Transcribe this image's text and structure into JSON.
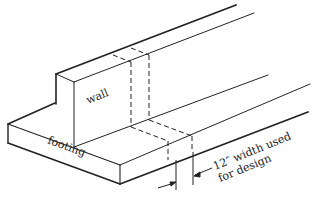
{
  "figure": {
    "type": "isometric-section",
    "labels": {
      "wall": "wall",
      "footing": "footing",
      "annotation_line1": "12″ width used",
      "annotation_line2": "for design"
    },
    "colors": {
      "line": "#222222",
      "background": "#ffffff"
    }
  }
}
